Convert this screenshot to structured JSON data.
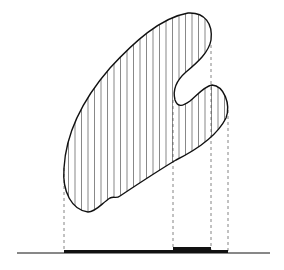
{
  "diagram": {
    "colors": {
      "stroke": "#111111",
      "hatch": "#555555",
      "dash": "#666666",
      "background": "#ffffff"
    },
    "projection_lines_x": [
      64,
      173,
      211,
      228
    ],
    "baseline": {
      "y": 253,
      "x_start": 17,
      "x_end": 270
    },
    "projection_bars": [
      {
        "x_start": 64,
        "x_end": 228,
        "thickness": 3,
        "label": "single-layer projection"
      },
      {
        "x_start": 173,
        "x_end": 211,
        "thickness": 6,
        "label": "double-layer projection"
      }
    ],
    "hatch_spacing": 6.5
  }
}
